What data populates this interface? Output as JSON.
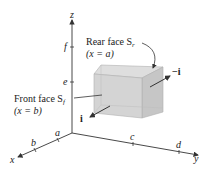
{
  "axes": {
    "x_label": "x",
    "y_label": "y",
    "z_label": "z",
    "x_ticks": [
      "a",
      "b"
    ],
    "y_ticks": [
      "c",
      "d"
    ],
    "z_ticks": [
      "e",
      "f"
    ]
  },
  "labels": {
    "rear_face_line1": "Rear face S",
    "rear_face_sub": "r",
    "rear_face_line2": "(x = a)",
    "front_face_line1": "Front face S",
    "front_face_sub": "f",
    "front_face_line2": "(x = b)",
    "vector_i": "i",
    "vector_neg_i": "−i"
  },
  "colors": {
    "box_front": "#d4d4d4",
    "box_side": "#c4c4c4",
    "box_top": "#dedede",
    "axis": "#333333"
  }
}
